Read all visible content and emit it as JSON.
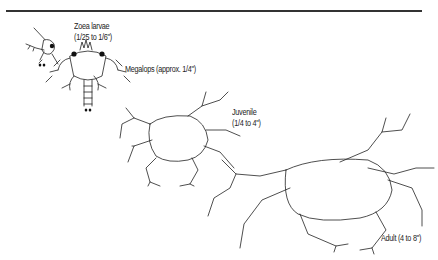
{
  "figure": {
    "stages": [
      {
        "name": "Zoea larvae",
        "size": "(1/25 to 1/6\")"
      },
      {
        "name": "Megalops",
        "size": "(approx. 1/4\")",
        "combined": "Megalops (approx. 1/4\")"
      },
      {
        "name": "Juvenile",
        "size": "(1/4 to 4\")"
      },
      {
        "name": "Adult",
        "size": "(4 to 8\")",
        "combined": "Adult (4 to 8\")"
      }
    ]
  }
}
